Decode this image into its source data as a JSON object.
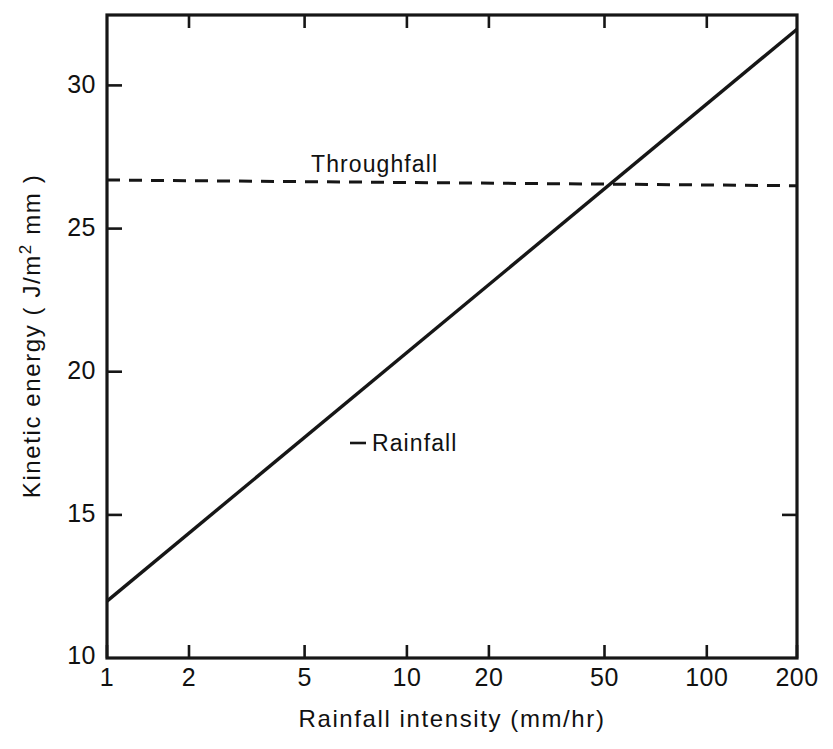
{
  "chart_data": {
    "type": "line",
    "title": "",
    "xlabel": "Rainfall intensity  (mm/hr)",
    "ylabel": "Kinetic energy  (J/m2 mm)",
    "ylabel_parts": {
      "before_sup": "Kinetic  energy  ( J/m",
      "sup": "2",
      "after_sup": " mm )"
    },
    "xscale": "log",
    "yscale": "linear",
    "xlim": [
      1,
      200
    ],
    "ylim": [
      10,
      32.6
    ],
    "grid": false,
    "legend": "inline-annotations",
    "x_ticks": [
      {
        "value": 1,
        "label": "1"
      },
      {
        "value": 2,
        "label": "2"
      },
      {
        "value": 5,
        "label": "5"
      },
      {
        "value": 10,
        "label": "10"
      },
      {
        "value": 20,
        "label": "20"
      },
      {
        "value": 50,
        "label": "50"
      },
      {
        "value": 100,
        "label": "100"
      },
      {
        "value": 200,
        "label": "200"
      }
    ],
    "y_ticks": [
      {
        "value": 10,
        "label": "10"
      },
      {
        "value": 15,
        "label": "15"
      },
      {
        "value": 20,
        "label": "20"
      },
      {
        "value": 25,
        "label": "25"
      },
      {
        "value": 30,
        "label": "30"
      }
    ],
    "series": [
      {
        "name": "Rainfall",
        "label": "- Rainfall",
        "style": "solid",
        "color": "#161616",
        "points": [
          {
            "x": 1,
            "y": 12.0
          },
          {
            "x": 2,
            "y": 14.6
          },
          {
            "x": 5,
            "y": 18.1
          },
          {
            "x": 10,
            "y": 20.8
          },
          {
            "x": 20,
            "y": 23.4
          },
          {
            "x": 50,
            "y": 26.9
          },
          {
            "x": 100,
            "y": 29.5
          },
          {
            "x": 200,
            "y": 32.1
          }
        ]
      },
      {
        "name": "Throughfall",
        "label": "Throughfall",
        "style": "dashed",
        "color": "#161616",
        "points": [
          {
            "x": 1,
            "y": 26.8
          },
          {
            "x": 200,
            "y": 26.6
          }
        ]
      }
    ],
    "annotations": [
      {
        "text": "Throughfall",
        "x": 10.5,
        "y": 28.2
      },
      {
        "text": "- Rainfall",
        "x": 7.0,
        "y": 18.6
      }
    ],
    "intersection_note": {
      "x": 50,
      "y": 26.8
    }
  }
}
